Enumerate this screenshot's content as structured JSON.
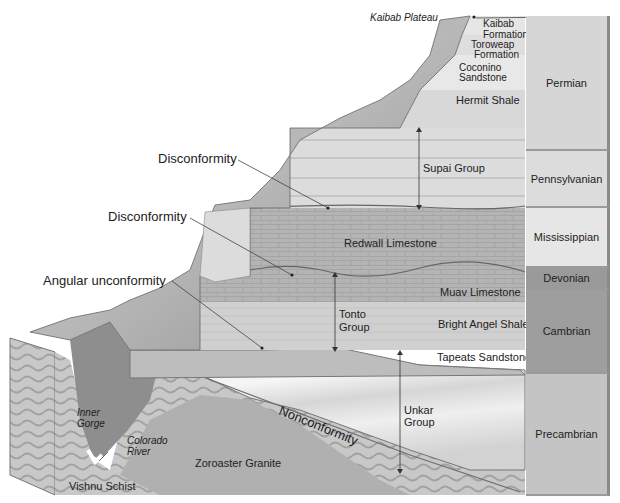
{
  "diagram": {
    "title_hint": "Grand Canyon stratigraphic cross-section",
    "top_label": "Kaibab Plateau",
    "formations": [
      {
        "id": "kaibab",
        "label": "Kaibab Formation"
      },
      {
        "id": "toroweap",
        "label": "Toroweap Formation"
      },
      {
        "id": "coconino",
        "label": "Coconino Sandstone"
      },
      {
        "id": "hermit",
        "label": "Hermit Shale"
      },
      {
        "id": "supai",
        "label": "Supai Group"
      },
      {
        "id": "redwall",
        "label": "Redwall Limestone"
      },
      {
        "id": "muav",
        "label": "Muav Limestone"
      },
      {
        "id": "bright_angel",
        "label": "Bright Angel Shale"
      },
      {
        "id": "tapeats",
        "label": "Tapeats Sandstone"
      },
      {
        "id": "unkar",
        "label": "Unkar Group"
      },
      {
        "id": "zoroaster",
        "label": "Zoroaster Granite"
      },
      {
        "id": "vishnu",
        "label": "Vishnu Schist"
      }
    ],
    "labels": {
      "kaibab_1": "Kaibab",
      "kaibab_2": "Formation",
      "toroweap_1": "Toroweap",
      "toroweap_2": "Formation",
      "coconino_1": "Coconino",
      "coconino_2": "Sandstone",
      "hermit": "Hermit Shale",
      "supai": "Supai Group",
      "redwall": "Redwall Limestone",
      "muav": "Muav Limestone",
      "tonto_1": "Tonto",
      "tonto_2": "Group",
      "bright_angel": "Bright Angel Shale",
      "tapeats": "Tapeats Sandstone",
      "unkar_1": "Unkar",
      "unkar_2": "Group",
      "zoroaster": "Zoroaster Granite",
      "vishnu": "Vishnu Schist",
      "inner_gorge_1": "Inner",
      "inner_gorge_2": "Gorge",
      "colorado_1": "Colorado",
      "colorado_2": "River"
    },
    "unconformities": {
      "disconformity_upper": "Disconformity",
      "disconformity_lower": "Disconformity",
      "angular": "Angular unconformity",
      "nonconformity": "Nonconformity"
    },
    "periods": [
      {
        "label": "Permian",
        "color": "#d6d6d6"
      },
      {
        "label": "Pennsylvanian",
        "color": "#dcdcdc"
      },
      {
        "label": "Mississippian",
        "color": "#e6e6e6"
      },
      {
        "label": "Devonian",
        "color": "#9a9a9a"
      },
      {
        "label": "Cambrian",
        "color": "#9e9e9e"
      },
      {
        "label": "Precambrian",
        "color": "#c4c4c4"
      }
    ]
  }
}
